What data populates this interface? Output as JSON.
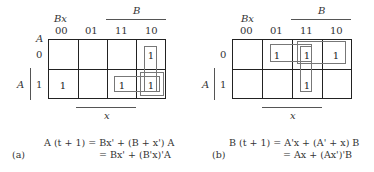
{
  "maps": [
    {
      "id": "a",
      "caption": "(a)",
      "col_var": "Bx",
      "row_var": "A",
      "top_var": "B",
      "bottom_var": "x",
      "columns": [
        "00",
        "01",
        "11",
        "10"
      ],
      "rows": [
        "0",
        "1"
      ],
      "cells": [
        [
          "",
          "",
          "",
          "1"
        ],
        [
          "1",
          "",
          "1",
          "1"
        ]
      ],
      "equation_line1": "A (t + 1) = Bx' + (B + x') A",
      "equation_line2": "= Bx' + (B'x)'A"
    },
    {
      "id": "b",
      "caption": "(b)",
      "col_var": "Bx",
      "row_var": "A",
      "top_var": "B",
      "bottom_var": "x",
      "columns": [
        "00",
        "01",
        "11",
        "10"
      ],
      "rows": [
        "0",
        "1"
      ],
      "cells": [
        [
          "",
          "1",
          "1",
          "1"
        ],
        [
          "",
          "",
          "1",
          ""
        ]
      ],
      "equation_line1": "B (t + 1) = A'x + (A' + x) B",
      "equation_line2": "= Ax + (Ax')'B"
    }
  ]
}
